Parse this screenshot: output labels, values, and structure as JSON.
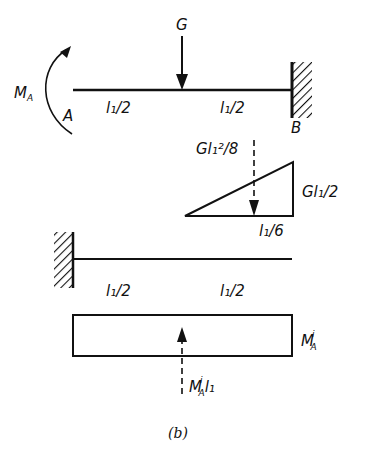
{
  "figure": {
    "caption": "(b)",
    "top_beam": {
      "load_label": "G",
      "moment_label_main": "M",
      "moment_label_sub": "A",
      "end_a_label": "A",
      "end_b_label": "B",
      "left_span_label": "l₁/2",
      "right_span_label": "l₁/2"
    },
    "moment_diagram": {
      "resultant_label": "Gl₁²/8",
      "height_label": "Gl₁/2",
      "offset_label": "l₁/6"
    },
    "conjugate_beam": {
      "left_span_label": "l₁/2",
      "right_span_label": "l₁/2"
    },
    "unit_diagram": {
      "height_label_main": "M",
      "height_label_sub": "A",
      "height_label_sup": "i",
      "resultant_label_main": "M",
      "resultant_label_sub": "A",
      "resultant_label_sup": "i",
      "resultant_label_tail": "l₁"
    }
  },
  "colors": {
    "ink": "#111111",
    "background": "#ffffff"
  }
}
